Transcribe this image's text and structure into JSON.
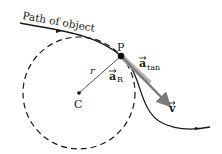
{
  "diagram": {
    "labels": {
      "path": "Path of object",
      "point": "P",
      "center": "C",
      "radius": "r",
      "a_radial_main": "a",
      "a_radial_sub": "R",
      "a_tan_main": "a",
      "a_tan_sub": "tan",
      "velocity": "v"
    },
    "colors": {
      "path": "#1a1a1a",
      "circle": "#1a1a1a",
      "radius_line": "#555555",
      "tangential_arrow": "#9a9a9a",
      "velocity_arrow": "#6f6f6f"
    }
  }
}
